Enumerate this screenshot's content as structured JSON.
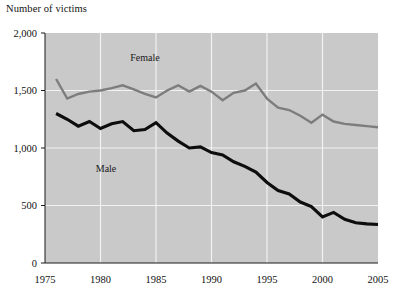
{
  "figure": {
    "axis_title": "Number of victims",
    "background_color": "#ffffff",
    "plot_background_color": "#c9c9c9",
    "gridline_color": "#f2f2f2",
    "axis_color": "#1a1a1a"
  },
  "labels": {
    "female": "Female",
    "male": "Male"
  },
  "colors": {
    "female_line": "#7d7d7d",
    "male_line": "#0d0d0d"
  },
  "chart_data": {
    "type": "line",
    "title": "Number of victims",
    "xlabel": "",
    "ylabel": "Number of victims",
    "xlim": [
      1975,
      2005
    ],
    "ylim": [
      0,
      2000
    ],
    "grid": true,
    "legend": "inline-labels",
    "xticks": [
      1975,
      1980,
      1985,
      1990,
      1995,
      2000,
      2005
    ],
    "xtick_labels": [
      "1975",
      "1980",
      "1985",
      "1990",
      "1995",
      "2000",
      "2005"
    ],
    "yticks": [
      0,
      500,
      1000,
      1500,
      2000
    ],
    "ytick_labels": [
      "0",
      "500",
      "1,000",
      "1,500",
      "2,000"
    ],
    "x": [
      1976,
      1977,
      1978,
      1979,
      1980,
      1981,
      1982,
      1983,
      1984,
      1985,
      1986,
      1987,
      1988,
      1989,
      1990,
      1991,
      1992,
      1993,
      1994,
      1995,
      1996,
      1997,
      1998,
      1999,
      2000,
      2001,
      2002,
      2003,
      2004,
      2005
    ],
    "series": [
      {
        "name": "Female",
        "color": "#7d7d7d",
        "values": [
          1600,
          1430,
          1470,
          1490,
          1500,
          1520,
          1545,
          1510,
          1470,
          1440,
          1500,
          1545,
          1490,
          1540,
          1490,
          1415,
          1480,
          1500,
          1560,
          1430,
          1350,
          1330,
          1280,
          1220,
          1290,
          1230,
          1210,
          1200,
          1190,
          1180
        ]
      },
      {
        "name": "Male",
        "color": "#0d0d0d",
        "values": [
          1300,
          1250,
          1190,
          1230,
          1170,
          1210,
          1230,
          1150,
          1160,
          1220,
          1130,
          1060,
          1000,
          1010,
          960,
          940,
          880,
          840,
          790,
          700,
          630,
          600,
          530,
          490,
          400,
          440,
          380,
          350,
          340,
          335
        ]
      }
    ],
    "annotations": [
      {
        "text": "Female",
        "x": 1984,
        "y": 1760
      },
      {
        "text": "Male",
        "x": 1980.5,
        "y": 790
      }
    ]
  }
}
